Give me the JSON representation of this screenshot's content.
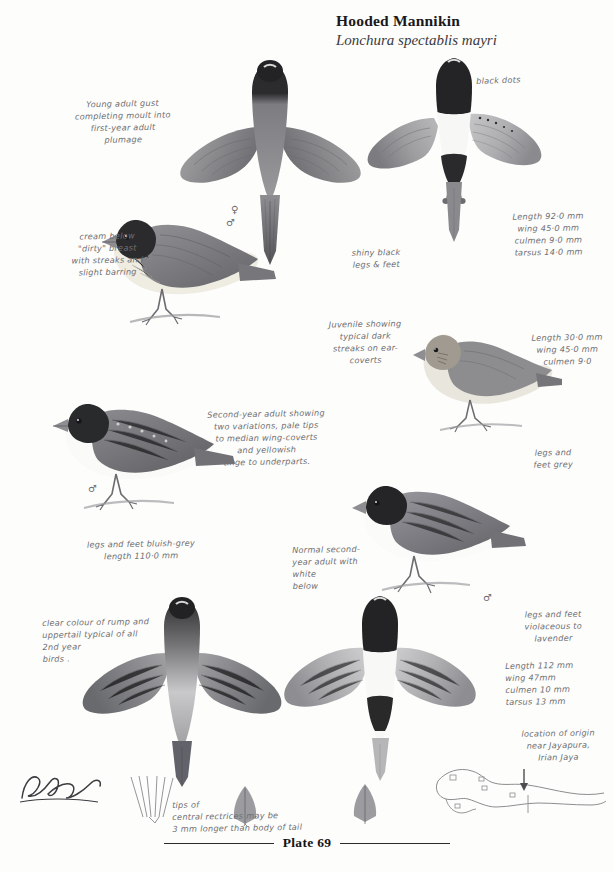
{
  "heading": {
    "common_name": "Hooded Mannikin",
    "scientific_name": "Lonchura spectablis mayri"
  },
  "footer": {
    "plate_label": "Plate 69"
  },
  "annotations": {
    "young_adult": "Young adult gust\ncompleting moult into\nfirst-year adult\nplumage",
    "cream_below": "cream below\n\"dirty\" breast\nwith streaks and\nslight barring",
    "black_dots": "black dots",
    "measurements_female": "Length 92·0 mm\nwing 45·0 mm\nculmen 9·0 mm\ntarsus 14·0 mm",
    "shiny_black_legs": "shiny black\nlegs & feet",
    "juvenile": "Juvenile showing\ntypical dark\nstreaks on ear-\ncoverts",
    "measurements_juvenile": "Length 30·0 mm\nwing 45·0 mm\nculmen 9·0",
    "legs_feet_grey": "legs and\nfeet grey",
    "second_year": "Second-year adult showing\ntwo variations, pale tips\nto median wing-coverts\nand yellowish\ntinge to underparts.",
    "legs_bluish_grey": "legs and feet bluish-grey\nlength 110·0 mm",
    "normal_second_year": "Normal second-\nyear adult with\nwhite\nbelow",
    "legs_violaceous": "legs and feet\nviolaceous to\nlavender",
    "measurements_male": "Length 112 mm\nwing 47mm\nculmen 10 mm\ntarsus 13 mm",
    "rump_colour": "clear colour of rump and\nuppertail typical of all\n2nd year\nbirds .",
    "rectrices": "tips of\ncentral rectrices may be\n3 mm longer than body of tail",
    "map_location": "location of origin\nnear Jayapura,\nIrian Jaya"
  },
  "symbols": {
    "female_spread": "♀",
    "female_perched": "♂",
    "male_second_year": "♂",
    "male_normal": "♂"
  },
  "colors": {
    "ink": "#6f6f72",
    "print_black": "#19191b",
    "hood_dark": "#262629",
    "mantle_mid": "#8d8d90",
    "wing_grey": "#9b9b9e",
    "belly_cream": "#efece3",
    "belly_white": "#fbfbfa",
    "rump_pale": "#c9c9cb",
    "paper": "#fdfdfc"
  }
}
